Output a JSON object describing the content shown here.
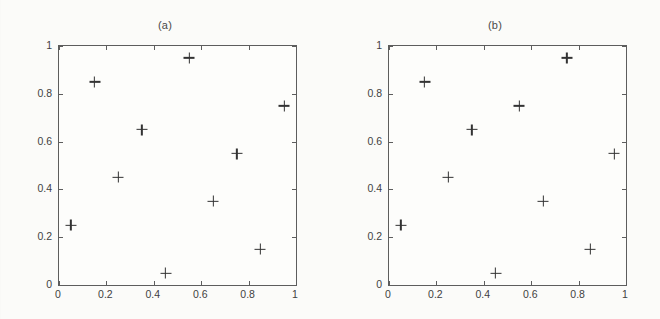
{
  "figure": {
    "background_color": "#fbfbf9",
    "ink_color": "#333333",
    "axis_color": "#5d5d5d",
    "marker_symbol": "+"
  },
  "chart_data": [
    {
      "type": "scatter",
      "title": "(a)",
      "xlabel": "",
      "ylabel": "",
      "xlim": [
        0,
        1
      ],
      "ylim": [
        0,
        1
      ],
      "grid": false,
      "legend": null,
      "marker": "+",
      "xticks": [
        0,
        0.2,
        0.4,
        0.6,
        0.8,
        1
      ],
      "yticks": [
        0,
        0.2,
        0.4,
        0.6,
        0.8,
        1
      ],
      "xticklabels": [
        "0",
        "0.2",
        "0.4",
        "0.6",
        "0.8",
        "1"
      ],
      "yticklabels": [
        "0",
        "0.2",
        "0.4",
        "0.6",
        "0.8",
        "1"
      ],
      "x": [
        0.55,
        0.15,
        0.95,
        0.35,
        0.75,
        0.25,
        0.65,
        0.05,
        0.85,
        0.45
      ],
      "y": [
        0.95,
        0.85,
        0.75,
        0.65,
        0.55,
        0.45,
        0.35,
        0.25,
        0.15,
        0.05
      ]
    },
    {
      "type": "scatter",
      "title": "(b)",
      "xlabel": "",
      "ylabel": "",
      "xlim": [
        0,
        1
      ],
      "ylim": [
        0,
        1
      ],
      "grid": false,
      "legend": null,
      "marker": "+",
      "xticks": [
        0,
        0.2,
        0.4,
        0.6,
        0.8,
        1
      ],
      "yticks": [
        0,
        0.2,
        0.4,
        0.6,
        0.8,
        1
      ],
      "xticklabels": [
        "0",
        "0.2",
        "0.4",
        "0.6",
        "0.8",
        "1"
      ],
      "yticklabels": [
        "0",
        "0.2",
        "0.4",
        "0.6",
        "0.8",
        "1"
      ],
      "x": [
        0.75,
        0.15,
        0.55,
        0.35,
        0.95,
        0.25,
        0.65,
        0.05,
        0.85,
        0.45
      ],
      "y": [
        0.95,
        0.85,
        0.75,
        0.65,
        0.55,
        0.45,
        0.35,
        0.25,
        0.15,
        0.05
      ]
    }
  ]
}
